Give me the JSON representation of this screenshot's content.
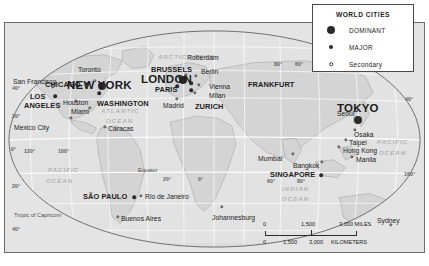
{
  "map": {
    "title": "World Cities Map",
    "projection_note": "oval world projection with graticule",
    "colors": {
      "land": "#d2d2d2",
      "ocean": "#e4e4e4",
      "graticule": "#ffffff",
      "border": "#6b6b6b",
      "city_dot": "#2b2b2b",
      "text": "#1c1c1c",
      "ocean_label": "#b2b2b2"
    }
  },
  "legend": {
    "title": "WORLD CITIES",
    "items": [
      {
        "label": "DOMINANT",
        "symbol": "large-filled-circle",
        "class": "dominant"
      },
      {
        "label": "MAJOR",
        "symbol": "small-filled-circle",
        "class": "major"
      },
      {
        "label": "Secondary",
        "symbol": "small-open-circle",
        "class": "secondary"
      }
    ]
  },
  "scalebar": {
    "miles": {
      "start": "0",
      "mid": "1,500",
      "end": "3,000 MILES"
    },
    "kilometers": {
      "start": "0",
      "mid": "1,500",
      "mid2": "3,000",
      "end": "KILOMETERS"
    }
  },
  "caption": "",
  "cities": [
    {
      "name": "NEW YORK",
      "class": "dominant",
      "dot_x": 97,
      "dot_y": 63,
      "label_x": 62,
      "label_y": 56,
      "anchor": "left"
    },
    {
      "name": "LONDON",
      "class": "dominant",
      "dot_x": 178,
      "dot_y": 57,
      "label_x": 136,
      "label_y": 50,
      "anchor": "left"
    },
    {
      "name": "TOKYO",
      "class": "dominant",
      "dot_x": 353,
      "dot_y": 97,
      "label_x": 332,
      "label_y": 79,
      "anchor": "left"
    },
    {
      "name": "CHICAGO",
      "class": "major",
      "dot_x": 82,
      "dot_y": 61,
      "label_x": 40,
      "label_y": 57,
      "anchor": "left"
    },
    {
      "name": "LOS",
      "class": "major",
      "dot_x": 50,
      "dot_y": 73,
      "label_x": 25,
      "label_y": 69,
      "anchor": "left"
    },
    {
      "name": "ANGELES",
      "class": "major",
      "dot_x": -1,
      "dot_y": -1,
      "label_x": 19,
      "label_y": 78,
      "anchor": "left"
    },
    {
      "name": "WASHINGTON",
      "class": "major",
      "dot_x": 94,
      "dot_y": 70,
      "label_x": 92,
      "label_y": 76,
      "anchor": "left"
    },
    {
      "name": "SÃO PAULO",
      "class": "major",
      "dot_x": 129,
      "dot_y": 174,
      "label_x": 78,
      "label_y": 169,
      "anchor": "left"
    },
    {
      "name": "BRUSSELS",
      "class": "major",
      "dot_x": 175,
      "dot_y": 54,
      "label_x": 146,
      "label_y": 42,
      "anchor": "left"
    },
    {
      "name": "PARIS",
      "class": "major",
      "dot_x": 172,
      "dot_y": 63,
      "label_x": 150,
      "label_y": 62,
      "anchor": "left"
    },
    {
      "name": "ZURICH",
      "class": "major",
      "dot_x": 186,
      "dot_y": 67,
      "label_x": 190,
      "label_y": 79,
      "anchor": "left"
    },
    {
      "name": "FRANKFURT",
      "class": "major",
      "dot_x": 186,
      "dot_y": 60,
      "label_x": 243,
      "label_y": 57,
      "anchor": "left"
    },
    {
      "name": "SINGAPORE",
      "class": "major",
      "dot_x": 316,
      "dot_y": 152,
      "label_x": 265,
      "label_y": 147,
      "anchor": "left"
    },
    {
      "name": "San Francisco",
      "class": "secondary",
      "dot_x": 48,
      "dot_y": 64,
      "label_x": 8,
      "label_y": 55,
      "anchor": "left"
    },
    {
      "name": "Toronto",
      "class": "secondary",
      "dot_x": 90,
      "dot_y": 58,
      "label_x": 73,
      "label_y": 43,
      "anchor": "left"
    },
    {
      "name": "Houston",
      "class": "secondary",
      "dot_x": 71,
      "dot_y": 78,
      "label_x": 58,
      "label_y": 76,
      "anchor": "left"
    },
    {
      "name": "Miami",
      "class": "secondary",
      "dot_x": 85,
      "dot_y": 85,
      "label_x": 66,
      "label_y": 85,
      "anchor": "left"
    },
    {
      "name": "Mexico City",
      "class": "secondary",
      "dot_x": 66,
      "dot_y": 95,
      "label_x": 9,
      "label_y": 101,
      "anchor": "left"
    },
    {
      "name": "Caracas",
      "class": "secondary",
      "dot_x": 100,
      "dot_y": 104,
      "label_x": 103,
      "label_y": 102,
      "anchor": "left"
    },
    {
      "name": "Rio de Janeiro",
      "class": "secondary",
      "dot_x": 136,
      "dot_y": 173,
      "label_x": 140,
      "label_y": 170,
      "anchor": "left"
    },
    {
      "name": "Buenos Aires",
      "class": "secondary",
      "dot_x": 113,
      "dot_y": 194,
      "label_x": 116,
      "label_y": 192,
      "anchor": "left"
    },
    {
      "name": "Rotterdam",
      "class": "secondary",
      "dot_x": 181,
      "dot_y": 52,
      "label_x": 182,
      "label_y": 31,
      "anchor": "left"
    },
    {
      "name": "Berlin",
      "class": "secondary",
      "dot_x": 191,
      "dot_y": 53,
      "label_x": 196,
      "label_y": 45,
      "anchor": "left"
    },
    {
      "name": "Vienna",
      "class": "secondary",
      "dot_x": 194,
      "dot_y": 62,
      "label_x": 204,
      "label_y": 60,
      "anchor": "left"
    },
    {
      "name": "Milan",
      "class": "secondary",
      "dot_x": 190,
      "dot_y": 70,
      "label_x": 204,
      "label_y": 69,
      "anchor": "left"
    },
    {
      "name": "Madrid",
      "class": "secondary",
      "dot_x": 172,
      "dot_y": 76,
      "label_x": 158,
      "label_y": 79,
      "anchor": "left"
    },
    {
      "name": "Mumbai",
      "class": "secondary",
      "dot_x": 288,
      "dot_y": 131,
      "label_x": 253,
      "label_y": 132,
      "anchor": "left"
    },
    {
      "name": "Bangkok",
      "class": "secondary",
      "dot_x": 317,
      "dot_y": 139,
      "label_x": 288,
      "label_y": 139,
      "anchor": "left"
    },
    {
      "name": "Seoul",
      "class": "secondary",
      "dot_x": 352,
      "dot_y": 88,
      "label_x": 332,
      "label_y": 87,
      "anchor": "left"
    },
    {
      "name": "Osaka",
      "class": "secondary",
      "dot_x": 350,
      "dot_y": 107,
      "label_x": 349,
      "label_y": 108,
      "anchor": "left"
    },
    {
      "name": "Taipei",
      "class": "secondary",
      "dot_x": 341,
      "dot_y": 117,
      "label_x": 344,
      "label_y": 116,
      "anchor": "left"
    },
    {
      "name": "Hong Kong",
      "class": "secondary",
      "dot_x": 334,
      "dot_y": 124,
      "label_x": 338,
      "label_y": 124,
      "anchor": "left"
    },
    {
      "name": "Manila",
      "class": "secondary",
      "dot_x": 347,
      "dot_y": 134,
      "label_x": 351,
      "label_y": 133,
      "anchor": "left"
    },
    {
      "name": "Johannesburg",
      "class": "secondary",
      "dot_x": 217,
      "dot_y": 184,
      "label_x": 207,
      "label_y": 191,
      "anchor": "left"
    },
    {
      "name": "Sydney",
      "class": "secondary",
      "dot_x": 386,
      "dot_y": 202,
      "label_x": 372,
      "label_y": 194,
      "anchor": "left"
    }
  ],
  "ocean_labels": [
    {
      "text": "ARCTIC",
      "x": 153,
      "y": 31
    },
    {
      "text": "OCEAN",
      "x": 183,
      "y": 31
    },
    {
      "text": "ATLANTIC",
      "x": 96,
      "y": 85
    },
    {
      "text": "OCEAN",
      "x": 101,
      "y": 95
    },
    {
      "text": "PACIFIC",
      "x": 43,
      "y": 144
    },
    {
      "text": "OCEAN",
      "x": 41,
      "y": 155
    },
    {
      "text": "PACIFIC",
      "x": 372,
      "y": 116
    },
    {
      "text": "OCEAN",
      "x": 374,
      "y": 127
    },
    {
      "text": "INDIAN",
      "x": 277,
      "y": 163
    },
    {
      "text": "OCEAN",
      "x": 277,
      "y": 173
    }
  ],
  "line_labels": [
    {
      "text": "Equator",
      "x": 133,
      "y": 144
    },
    {
      "text": "Tropic of Capricorn",
      "x": 9,
      "y": 189
    }
  ],
  "graticule_labels": [
    {
      "text": "80°",
      "x": 269,
      "y": 38
    },
    {
      "text": "60°",
      "x": 290,
      "y": 38
    },
    {
      "text": "40°",
      "x": 7,
      "y": 62
    },
    {
      "text": "40°",
      "x": 400,
      "y": 73
    },
    {
      "text": "20°",
      "x": 7,
      "y": 90
    },
    {
      "text": "0°",
      "x": 6,
      "y": 123
    },
    {
      "text": "120°",
      "x": 19,
      "y": 125
    },
    {
      "text": "100°",
      "x": 53,
      "y": 125
    },
    {
      "text": "20°",
      "x": 7,
      "y": 160
    },
    {
      "text": "20°",
      "x": 158,
      "y": 153
    },
    {
      "text": "0°",
      "x": 193,
      "y": 153
    },
    {
      "text": "60°",
      "x": 262,
      "y": 155
    },
    {
      "text": "80°",
      "x": 292,
      "y": 155
    },
    {
      "text": "160°",
      "x": 399,
      "y": 148
    },
    {
      "text": "40°",
      "x": 7,
      "y": 203
    },
    {
      "text": "60°",
      "x": 7,
      "y": 232
    }
  ]
}
